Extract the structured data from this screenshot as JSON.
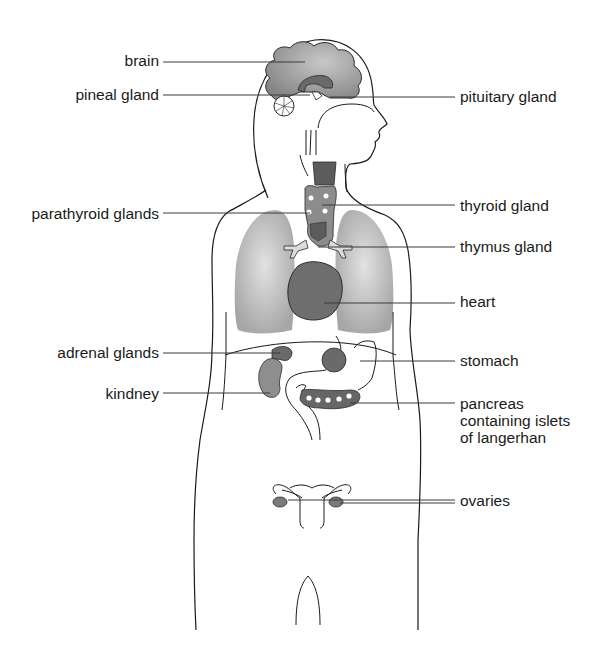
{
  "diagram": {
    "type": "labeled-anatomy",
    "colors": {
      "outline": "#1a1a1a",
      "brain_gray": "#8f8f8f",
      "dark_organ": "#6e6e6e",
      "medium_organ": "#8a8a8a",
      "lung_gray": "#b4b4b4",
      "leader_line": "#3a3a3a",
      "background": "#ffffff"
    },
    "labels": {
      "left": [
        {
          "id": "brain",
          "text": "brain"
        },
        {
          "id": "pineal",
          "text": "pineal gland"
        },
        {
          "id": "parathyroid",
          "text": "parathyroid glands"
        },
        {
          "id": "adrenal",
          "text": "adrenal glands"
        },
        {
          "id": "kidney",
          "text": "kindney"
        }
      ],
      "right": [
        {
          "id": "pituitary",
          "text": "pituitary gland"
        },
        {
          "id": "thyroid",
          "text": "thyroid gland"
        },
        {
          "id": "thymus",
          "text": "thymus gland"
        },
        {
          "id": "heart",
          "text": "heart"
        },
        {
          "id": "stomach",
          "text": "stomach"
        },
        {
          "id": "pancreas",
          "lines": [
            "pancreas",
            "containing islets",
            "of langerhan"
          ]
        },
        {
          "id": "ovaries",
          "text": "ovaries"
        }
      ]
    }
  }
}
